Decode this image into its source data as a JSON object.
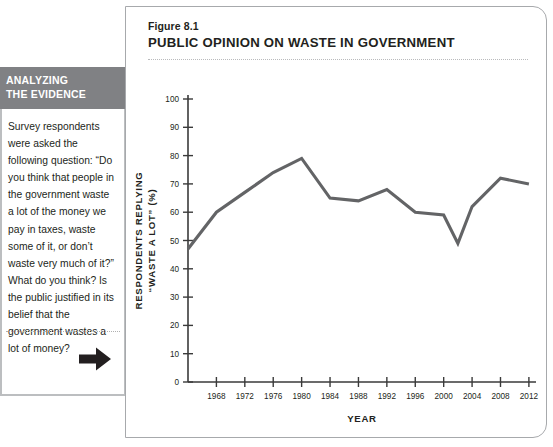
{
  "sidebar": {
    "header_line1": "ANALYZING",
    "header_line2": "THE EVIDENCE",
    "body_text": "Survey respondents were asked the following question: “Do you think that people in the government waste a lot of the money we pay in taxes, waste some of it, or don’t waste very much of it?” What do you think? Is the public justified in its belief that the government wastes a lot of money?",
    "arrow_icon": "arrow-right-icon",
    "header_bg": "#808184",
    "border_color": "#bcbec0"
  },
  "figure": {
    "number": "Figure 8.1",
    "title": "PUBLIC OPINION ON WASTE IN GOVERNMENT"
  },
  "chart_data": {
    "type": "line",
    "title": "PUBLIC OPINION ON WASTE IN GOVERNMENT",
    "xlabel": "YEAR",
    "ylabel": "RESPONDENTS REPLYING “WASTE A LOT” (%)",
    "ylabel_line1": "RESPONDENTS REPLYING",
    "ylabel_line2": "“WASTE A LOT” (%)",
    "xlim": [
      1964,
      2013
    ],
    "ylim": [
      0,
      100
    ],
    "ytick_step": 10,
    "xtick_step": 4,
    "grid": false,
    "legend": null,
    "line_color": "#636466",
    "yticks": [
      0,
      10,
      20,
      30,
      40,
      50,
      60,
      70,
      80,
      90,
      100
    ],
    "ytick_labels": [
      "0",
      "10",
      "20",
      "30",
      "40",
      "50",
      "60",
      "70",
      "80",
      "90",
      "100"
    ],
    "xticks": [
      1968,
      1972,
      1976,
      1980,
      1984,
      1988,
      1992,
      1996,
      2000,
      2004,
      2008,
      2012
    ],
    "xtick_labels": [
      "1968",
      "1972",
      "1976",
      "1980",
      "1984",
      "1988",
      "1992",
      "1996",
      "2000",
      "2004",
      "2008",
      "2012"
    ],
    "x": [
      1964,
      1968,
      1972,
      1976,
      1980,
      1984,
      1988,
      1992,
      1996,
      2000,
      2002,
      2004,
      2008,
      2012
    ],
    "values": [
      47,
      60,
      67,
      74,
      79,
      65,
      64,
      68,
      60,
      59,
      49,
      62,
      72,
      70
    ],
    "series": [
      {
        "name": "Waste a lot",
        "x": [
          1964,
          1968,
          1972,
          1976,
          1980,
          1984,
          1988,
          1992,
          1996,
          2000,
          2002,
          2004,
          2008,
          2012
        ],
        "values": [
          47,
          60,
          67,
          74,
          79,
          65,
          64,
          68,
          60,
          59,
          49,
          62,
          72,
          70
        ]
      }
    ]
  }
}
